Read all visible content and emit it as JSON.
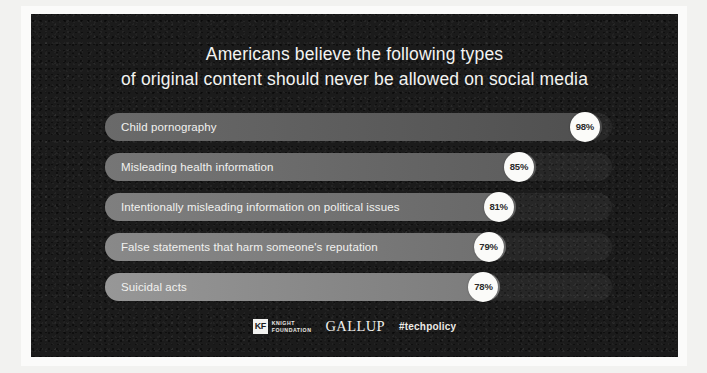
{
  "card": {
    "background_color": "#1b1b1b",
    "frame_color": "#fbfbfa",
    "page_background": "#f2f2f0"
  },
  "title": {
    "line1": "Americans believe the following types",
    "line2": "of original content should never be allowed on social media",
    "color": "#f3f3f1"
  },
  "chart_data": {
    "type": "bar",
    "orientation": "horizontal",
    "title": "Americans believe the following types of original content should never be allowed on social media",
    "xlabel": "",
    "ylabel": "",
    "xlim": [
      0,
      100
    ],
    "unit": "%",
    "grid": false,
    "legend": "none",
    "value_label_style": "white-circle-badge",
    "categories": [
      "Child pornography",
      "Misleading health information",
      "Intentionally misleading information on political issues",
      "False statements that harm someone's reputation",
      "Suicidal acts"
    ],
    "values": [
      98,
      85,
      81,
      79,
      78
    ],
    "value_labels": [
      "98%",
      "85%",
      "81%",
      "79%",
      "78%"
    ],
    "bar_colors": [
      "#575757",
      "#656565",
      "#6f6f6f",
      "#787878",
      "#848484"
    ],
    "track_color": "rgba(255,255,255,0.055)"
  },
  "bars": [
    {
      "label": "Child pornography",
      "value": 98,
      "value_label": "98%",
      "fill_start": "#6a6a6a",
      "fill_end": "#4f4f4f"
    },
    {
      "label": "Misleading health information",
      "value": 85,
      "value_label": "85%",
      "fill_start": "#767676",
      "fill_end": "#5d5d5d"
    },
    {
      "label": "Intentionally misleading information on political issues",
      "value": 81,
      "value_label": "81%",
      "fill_start": "#7f7f7f",
      "fill_end": "#676767"
    },
    {
      "label": "False statements that harm someone's reputation",
      "value": 79,
      "value_label": "79%",
      "fill_start": "#898989",
      "fill_end": "#6f6f6f"
    },
    {
      "label": "Suicidal acts",
      "value": 78,
      "value_label": "78%",
      "fill_start": "#979797",
      "fill_end": "#7b7b7b"
    }
  ],
  "footer": {
    "knight_mark": "KF",
    "knight_line1": "KNIGHT",
    "knight_line2": "FOUNDATION",
    "gallup": "GALLUP",
    "hashtag": "#techpolicy"
  }
}
